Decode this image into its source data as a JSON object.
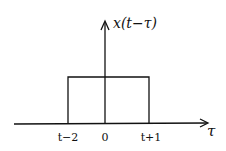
{
  "diagram": {
    "title_label": "x(t−τ)",
    "x_axis_label": "τ",
    "ticks": [
      {
        "label": "t−2",
        "x": 68
      },
      {
        "label": "0",
        "x": 105
      },
      {
        "label": "t+1",
        "x": 149
      }
    ],
    "pulse": {
      "left": "t−2",
      "right": "t+1",
      "height": "1"
    },
    "stroke_color": "#111111",
    "background": "#ffffff"
  }
}
